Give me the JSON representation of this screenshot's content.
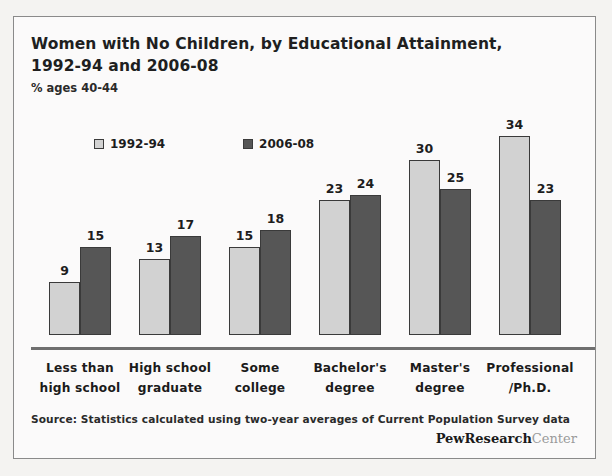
{
  "chart_data": {
    "type": "bar",
    "title": "Women with No Children, by Educational Attainment, 1992-94 and 2006-08",
    "subtitle": "% ages 40-44",
    "xlabel": "",
    "ylabel": "",
    "ylim": [
      0,
      37
    ],
    "grid": false,
    "legend_position": "top-left",
    "categories": [
      "Less than high school",
      "High school graduate",
      "Some college",
      "Bachelor's degree",
      "Master's degree",
      "Professional /Ph.D."
    ],
    "category_lines": [
      [
        "Less than",
        "high school"
      ],
      [
        "High school",
        "graduate"
      ],
      [
        "Some",
        "college"
      ],
      [
        "Bachelor's",
        "degree"
      ],
      [
        "Master's",
        "degree"
      ],
      [
        "Professional",
        "/Ph.D."
      ]
    ],
    "series": [
      {
        "name": "1992-94",
        "color": "#d2d2d2",
        "values": [
          9,
          13,
          15,
          23,
          30,
          34
        ]
      },
      {
        "name": "2006-08",
        "color": "#565656",
        "values": [
          15,
          17,
          18,
          24,
          25,
          23
        ]
      }
    ],
    "source": "Source: Statistics calculated using two-year averages of Current Population Survey data"
  },
  "brand": {
    "primary": "PewResearch",
    "secondary": "Center"
  }
}
